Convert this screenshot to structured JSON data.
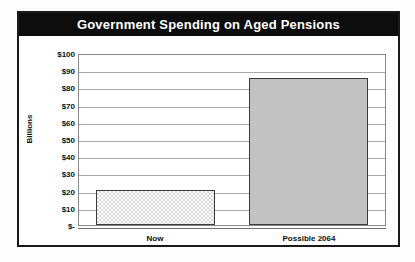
{
  "chart_data": {
    "type": "bar",
    "title": "Government Spending on Aged Pensions",
    "categories": [
      "Now",
      "Possible 2064"
    ],
    "values": [
      20.5,
      85.5
    ],
    "series": [
      {
        "name": "Government Spending on Aged Pensions",
        "values": [
          20.5,
          85.5
        ]
      }
    ],
    "xlabel": "",
    "ylabel": "Billions",
    "ylim": [
      0,
      100
    ],
    "ytick_values": [
      0,
      10,
      20,
      30,
      40,
      50,
      60,
      70,
      80,
      90,
      100
    ],
    "ytick_labels": [
      "$-",
      "$10",
      "$20",
      "$30",
      "$40",
      "$50",
      "$60",
      "$70",
      "$80",
      "$90",
      "$100"
    ],
    "grid": true,
    "legend": false,
    "bar_styles": [
      "checkered",
      "solid-gray"
    ],
    "colors": {
      "title_banner": "#0d0d0d",
      "title_text": "#ffffff",
      "frame": "#1a1a1a",
      "gridline": "#a8a8a8",
      "plot_background": "#ffffff",
      "bar_now_fill": "#ffffff",
      "bar_now_pattern": "#d8d8d8",
      "bar_possible_fill": "#c2c2c2",
      "bar_border": "#3a3a3a",
      "axis_text": "#111111"
    }
  }
}
